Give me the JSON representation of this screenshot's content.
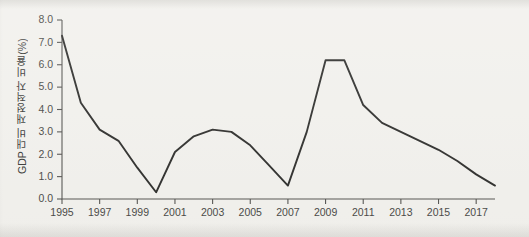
{
  "chart_data": {
    "type": "line",
    "title": "",
    "xlabel": "",
    "ylabel": "GDP 대비 재정적자 비율(%)",
    "ylim": [
      0.0,
      8.0
    ],
    "xlim": [
      1995,
      2018
    ],
    "grid": false,
    "legend": "none",
    "y_ticks": [
      "0.0",
      "1.0",
      "2.0",
      "3.0",
      "4.0",
      "5.0",
      "6.0",
      "7.0",
      "8.0"
    ],
    "y_tick_values": [
      0.0,
      1.0,
      2.0,
      3.0,
      4.0,
      5.0,
      6.0,
      7.0,
      8.0
    ],
    "x_ticks": [
      "1995",
      "1997",
      "1999",
      "2001",
      "2003",
      "2005",
      "2007",
      "2009",
      "2011",
      "2013",
      "2015",
      "2017"
    ],
    "x_tick_values": [
      1995,
      1997,
      1999,
      2001,
      2003,
      2005,
      2007,
      2009,
      2011,
      2013,
      2015,
      2017
    ],
    "x": [
      1995,
      1996,
      1997,
      1998,
      1999,
      2000,
      2001,
      2002,
      2003,
      2004,
      2005,
      2006,
      2007,
      2008,
      2009,
      2010,
      2011,
      2012,
      2013,
      2014,
      2015,
      2016,
      2017,
      2018
    ],
    "values": [
      7.3,
      4.3,
      3.1,
      2.6,
      1.4,
      0.3,
      2.1,
      2.8,
      3.1,
      3.0,
      2.4,
      1.5,
      0.6,
      3.0,
      6.2,
      6.2,
      4.2,
      3.4,
      3.0,
      2.6,
      2.2,
      1.7,
      1.1,
      0.6
    ],
    "series_name": "GDP 대비 재정적자 비율",
    "line_color": "#2f2f2d",
    "background_color": "#f2f1ed",
    "axis_color": "#575653"
  }
}
